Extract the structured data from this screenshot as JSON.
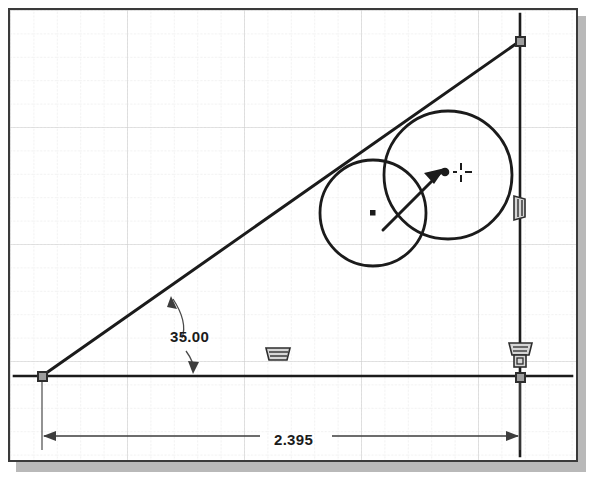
{
  "app": {
    "view_name": "sketch-canvas",
    "background_color": "#ffffff",
    "border_color": "#3a3a3a",
    "shadow_color": "#b9b9b9",
    "geometry_color": "#1b1b1b",
    "grid_minor_color": "#e2e2e2",
    "grid_major_color": "#cfcfcf",
    "handle_fill": "#9d9d9d",
    "handle_stroke": "#2e2e2e"
  },
  "grid": {
    "minor_spacing": 23.4,
    "major_every": 5
  },
  "dimensions": [
    {
      "id": "angle-dimension",
      "type": "angular",
      "value": "35.00",
      "unit": "degrees",
      "text_x": 160,
      "text_y": 318
    },
    {
      "id": "length-dimension",
      "type": "linear",
      "value": "2.395",
      "unit": "inches",
      "text_x": 264,
      "text_y": 421
    }
  ],
  "geometry": {
    "horizontal_line": {
      "x1": 12,
      "y1": 374,
      "x2": 566,
      "y2": 374
    },
    "vertical_line": {
      "x1": 518,
      "y1": 12,
      "x2": 518,
      "y2": 452
    },
    "inclined_line": {
      "x1": 40,
      "y1": 374,
      "x2": 518,
      "y2": 39
    },
    "circles": [
      {
        "id": "circle-left",
        "cx": 371,
        "cy": 211,
        "r": 53
      },
      {
        "id": "circle-right",
        "cx": 446,
        "cy": 173,
        "r": 64
      }
    ],
    "center_points": [
      {
        "id": "center-point-left",
        "cx": 371,
        "cy": 211,
        "style": "square"
      },
      {
        "id": "center-point-right",
        "cx": 443,
        "cy": 170,
        "style": "dot"
      }
    ],
    "handles": [
      {
        "id": "endpoint-origin",
        "x": 40,
        "y": 374
      },
      {
        "id": "endpoint-top-right",
        "x": 518,
        "y": 39
      },
      {
        "id": "endpoint-bottom-right",
        "x": 518,
        "y": 375
      }
    ]
  },
  "cursor": {
    "id": "arrow-cursor",
    "tip_x": 443,
    "tip_y": 166,
    "tail_x": 381,
    "tail_y": 228,
    "crosshair_x": 459,
    "crosshair_y": 168
  },
  "constraints": [
    {
      "id": "constraint-horizontal-mid",
      "kind": "horizontal",
      "x": 273,
      "y": 352
    },
    {
      "id": "constraint-vertical-right",
      "kind": "vertical",
      "x": 518,
      "y": 207
    },
    {
      "id": "constraint-horizontal-corner",
      "kind": "horizontal",
      "x": 518,
      "y": 348
    },
    {
      "id": "constraint-coincident-corner",
      "kind": "coincident",
      "x": 518,
      "y": 362
    }
  ]
}
